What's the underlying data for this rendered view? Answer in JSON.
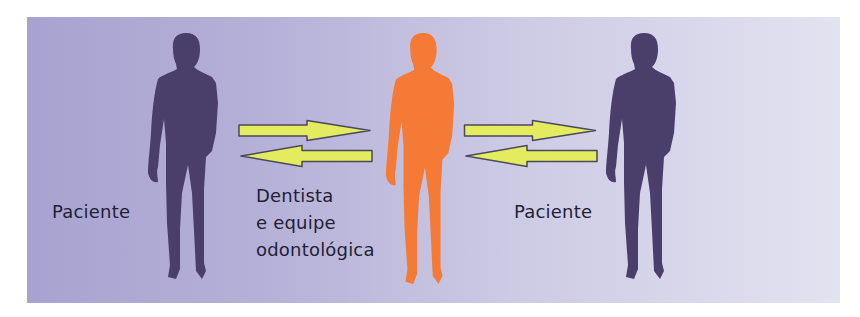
{
  "diagram": {
    "type": "communication-flow",
    "colors": {
      "background_left": "#a8a2d0",
      "background_right": "#e3e2f0",
      "patient_silhouette": "#4a3f6b",
      "dentist_silhouette": "#f57a35",
      "arrow_fill": "#e2ec5e",
      "arrow_outline": "#4a4860",
      "text": "#231f35"
    },
    "nodes": [
      {
        "id": "patient-left",
        "label": "Paciente",
        "icon": "person-silhouette-icon",
        "color": "#4a3f6b"
      },
      {
        "id": "dentist-team",
        "label_lines": [
          "Dentista",
          "e equipe",
          "odontológica"
        ],
        "icon": "person-silhouette-icon",
        "color": "#f57a35"
      },
      {
        "id": "patient-right",
        "label": "Paciente",
        "icon": "person-silhouette-icon",
        "color": "#4a3f6b"
      }
    ],
    "edges": [
      {
        "from": "patient-left",
        "to": "dentist-team",
        "direction": "right",
        "icon": "arrow-right-icon"
      },
      {
        "from": "dentist-team",
        "to": "patient-left",
        "direction": "left",
        "icon": "arrow-left-icon"
      },
      {
        "from": "dentist-team",
        "to": "patient-right",
        "direction": "right",
        "icon": "arrow-right-icon"
      },
      {
        "from": "patient-right",
        "to": "dentist-team",
        "direction": "left",
        "icon": "arrow-left-icon"
      }
    ]
  },
  "labels": {
    "left_patient": "Paciente",
    "dentist_line1": "Dentista",
    "dentist_line2": "e equipe",
    "dentist_line3": "odontológica",
    "right_patient": "Paciente"
  }
}
